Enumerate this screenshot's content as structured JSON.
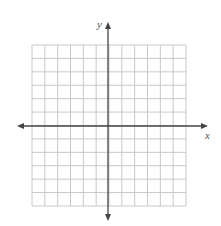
{
  "figure": {
    "grid": {
      "columns": 12,
      "rows": 12,
      "left": 32,
      "top": 45,
      "right": 186,
      "bottom": 206,
      "line_color": "#c8c8c8"
    },
    "axes": {
      "color": "#444444",
      "x_axis": {
        "label": "x",
        "y_position": 126,
        "from": 17,
        "to": 208
      },
      "y_axis": {
        "label": "y",
        "x_position": 108,
        "from": 22,
        "to": 221
      }
    }
  }
}
